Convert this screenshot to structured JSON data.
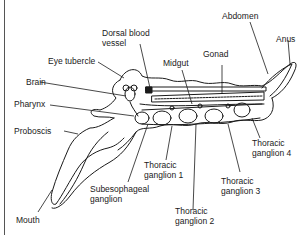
{
  "diagram": {
    "type": "anatomical",
    "labels": {
      "dorsal_blood_vessel_1": "Dorsal blood",
      "dorsal_blood_vessel_2": "vessel",
      "abdomen": "Abdomen",
      "anus": "Anus",
      "eye_tubercle": "Eye tubercle",
      "gonad": "Gonad",
      "midgut": "Midgut",
      "brain": "Brain",
      "pharynx": "Pharynx",
      "proboscis": "Proboscis",
      "thoracic_ganglion_1_a": "Thoracic",
      "thoracic_ganglion_1_b": "ganglion 1",
      "thoracic_ganglion_2_a": "Thoracic",
      "thoracic_ganglion_2_b": "ganglion 2",
      "thoracic_ganglion_3_a": "Thoracic",
      "thoracic_ganglion_3_b": "ganglion 3",
      "thoracic_ganglion_4_a": "Thoracic",
      "thoracic_ganglion_4_b": "ganglion 4",
      "subesophageal_a": "Subesophageal",
      "subesophageal_b": "ganglion",
      "mouth": "Mouth"
    },
    "colors": {
      "ink": "#1a1a1a",
      "background": "#ffffff"
    }
  }
}
